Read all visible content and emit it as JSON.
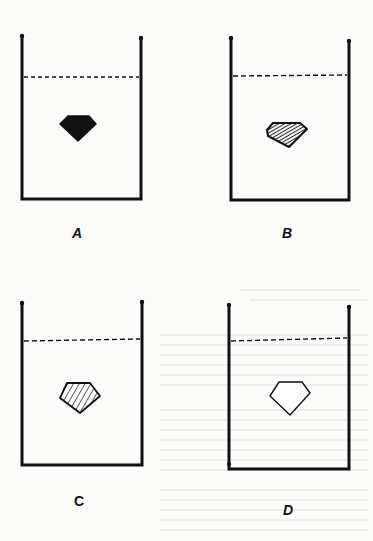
{
  "figure": {
    "panels": [
      {
        "id": "A",
        "label": "A",
        "gem_style": "solid-black",
        "box": {
          "x": 21,
          "y": 36,
          "w": 121,
          "h": 164
        },
        "liquid_y": 77,
        "gem": {
          "cx": 78,
          "cy": 126
        }
      },
      {
        "id": "B",
        "label": "B",
        "gem_style": "dense-hatched",
        "box": {
          "x": 230,
          "y": 38,
          "w": 119,
          "h": 163
        },
        "liquid_y": 76,
        "gem": {
          "cx": 287,
          "cy": 131
        }
      },
      {
        "id": "C",
        "label": "C",
        "gem_style": "light-hatched",
        "box": {
          "x": 21,
          "y": 302,
          "w": 122,
          "h": 165
        },
        "liquid_y": 341,
        "gem": {
          "cx": 80,
          "cy": 390
        }
      },
      {
        "id": "D",
        "label": "D",
        "gem_style": "outline-only",
        "box": {
          "x": 229,
          "y": 305,
          "w": 119,
          "h": 165
        },
        "liquid_y": 339,
        "gem": {
          "cx": 289,
          "cy": 390
        }
      }
    ],
    "colors": {
      "ink": "#111111",
      "paper": "#fbfbf9",
      "bleed": "#d9d9d4"
    }
  }
}
